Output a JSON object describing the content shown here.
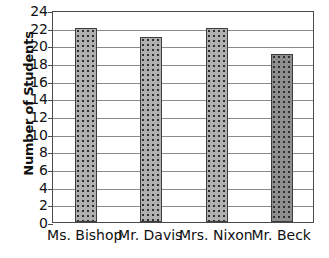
{
  "chart_data": {
    "type": "bar",
    "title": "",
    "xlabel": "",
    "ylabel": "Number of Students",
    "categories": [
      "Ms. Bishop",
      "Mr. Davis",
      "Mrs. Nixon",
      "Mr. Beck"
    ],
    "values": [
      22,
      21,
      22,
      19
    ],
    "ylim": [
      0,
      24
    ],
    "ytick_interval": 2,
    "yticks": [
      24,
      22,
      20,
      18,
      16,
      14,
      12,
      10,
      8,
      6,
      4,
      2,
      0
    ],
    "ytick_labels": [
      "24",
      "22",
      "20",
      "18",
      "16",
      "14",
      "12",
      "10",
      "8",
      "6",
      "4",
      "2",
      "0"
    ],
    "grid": "horizontal",
    "legend": "none",
    "bar_fill": "dotted-gray",
    "bar_border_color": "#3d3d3d",
    "bar_fill_color": "#b0b0b0",
    "gridline_color": "#8a8a8a",
    "frame_color": "#4a4a4a",
    "background": "#ffffff"
  }
}
